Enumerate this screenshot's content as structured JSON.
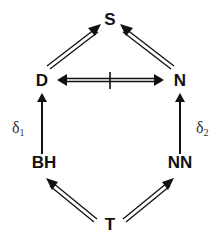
{
  "diagram": {
    "nodes": [
      {
        "id": "S",
        "label": "S"
      },
      {
        "id": "D",
        "label": "D"
      },
      {
        "id": "N",
        "label": "N"
      },
      {
        "id": "BH",
        "label": "BH"
      },
      {
        "id": "NN",
        "label": "NN"
      },
      {
        "id": "T",
        "label": "T"
      }
    ],
    "edges": [
      {
        "from": "D",
        "to": "S",
        "style": "double"
      },
      {
        "from": "N",
        "to": "S",
        "style": "double"
      },
      {
        "from": "D",
        "to": "N",
        "style": "double-bidirectional-blocked"
      },
      {
        "from": "BH",
        "to": "D",
        "style": "single",
        "label": "δ1"
      },
      {
        "from": "NN",
        "to": "N",
        "style": "single",
        "label": "δ2"
      },
      {
        "from": "T",
        "to": "BH",
        "style": "double"
      },
      {
        "from": "T",
        "to": "NN",
        "style": "double"
      }
    ],
    "labels": {
      "delta1_base": "δ",
      "delta1_sub": "1",
      "delta2_base": "δ",
      "delta2_sub": "2"
    }
  }
}
